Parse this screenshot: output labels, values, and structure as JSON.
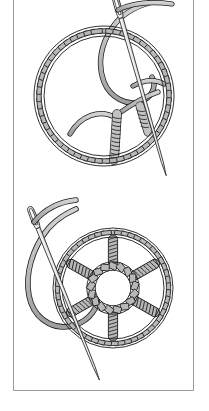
{
  "page": {
    "background_color": "#ffffff",
    "width": 209,
    "height": 411
  },
  "border": {
    "name": "page-rule",
    "color": "#9a9a9a",
    "stroke_width": 1,
    "left_x": 13.5,
    "right_x": 193.5,
    "top_y": 0,
    "bottom_y": 390.5,
    "description": "thin gray rule forming left and right margins and a bottom edge"
  },
  "palette": {
    "thread_fill": "#b8b8b8",
    "thread_fill_light": "#c9c9c9",
    "thread_shadow": "#9d9d9d",
    "outline": "#1a1a1a",
    "needle_fill": "#f2f2f2",
    "needle_outline": "#3a3a3a",
    "paper": "#ffffff"
  },
  "figures": [
    {
      "id": "figure-upper",
      "label": "Stage 1 - laying the foundation spokes",
      "stitch_name": "woven wheel stitch",
      "ring": {
        "center_x": 104,
        "center_y": 96,
        "radius_outer": 70,
        "radius_inner": 60,
        "segment_count": 56,
        "description": "couched/buttonholed outer ring of short gray bars"
      },
      "hub": {
        "center_x": 116,
        "center_y": 116,
        "wrapped": false
      },
      "spokes": [
        {
          "index": 1,
          "angle_deg": 200,
          "wrapped": false,
          "label": "plain foundation spoke"
        },
        {
          "index": 2,
          "angle_deg": 270,
          "wrapped": true,
          "label": "wrapped spoke"
        },
        {
          "index": 3,
          "angle_deg": 330,
          "wrapped": false,
          "label": "plain foundation spoke"
        }
      ],
      "needle": {
        "name": "sewing-needle",
        "eye_x": 121,
        "eye_y": 18,
        "tip_x": 166,
        "tip_y": 178,
        "angle_deg": 74,
        "threaded": true
      },
      "working_thread": {
        "name": "working-thread",
        "enters_top": true,
        "loop": "large loop crossing the upper right of the wheel"
      }
    },
    {
      "id": "figure-lower",
      "label": "Stage 2 - wheel with six wrapped spokes and woven hub",
      "stitch_name": "woven wheel stitch",
      "ring": {
        "center_x": 113,
        "center_y": 288,
        "radius_outer": 60,
        "radius_inner": 51,
        "segment_count": 52,
        "description": "couched/buttonholed outer ring of short gray bars"
      },
      "hub": {
        "center_x": 113,
        "center_y": 288,
        "radius": 22,
        "wrapped": true,
        "description": "central ring worked with whipped/woven wraps"
      },
      "spokes": [
        {
          "index": 1,
          "angle_deg": 270,
          "wrapped": true,
          "label": "wrapped spoke"
        },
        {
          "index": 2,
          "angle_deg": 330,
          "wrapped": true,
          "label": "wrapped spoke"
        },
        {
          "index": 3,
          "angle_deg": 30,
          "wrapped": true,
          "label": "wrapped spoke"
        },
        {
          "index": 4,
          "angle_deg": 90,
          "wrapped": true,
          "label": "wrapped spoke"
        },
        {
          "index": 5,
          "angle_deg": 150,
          "wrapped": true,
          "label": "wrapped spoke"
        },
        {
          "index": 6,
          "angle_deg": 210,
          "wrapped": true,
          "label": "wrapped spoke"
        }
      ],
      "needle": {
        "name": "sewing-needle",
        "eye_x": 38,
        "eye_y": 228,
        "tip_x": 97,
        "tip_y": 376,
        "angle_deg": 68,
        "threaded": true
      },
      "working_thread": {
        "name": "working-thread",
        "enters_top": true,
        "loop": "long loop sweeping down the left side and under the wheel"
      }
    }
  ]
}
